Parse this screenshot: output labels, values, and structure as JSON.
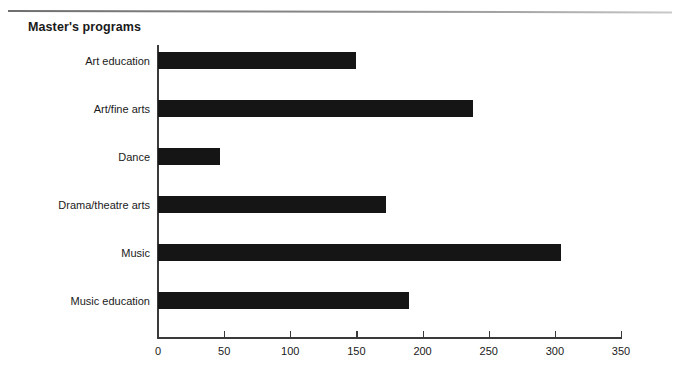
{
  "page": {
    "title": "Master's programs",
    "top_rule": "horizontal-rule"
  },
  "chart_data": {
    "type": "bar",
    "orientation": "horizontal",
    "title": "Master's programs",
    "xlabel": "",
    "ylabel": "",
    "categories": [
      "Art education",
      "Art/fine arts",
      "Dance",
      "Drama/theatre arts",
      "Music",
      "Music education"
    ],
    "values": [
      150,
      238,
      47,
      172,
      305,
      190
    ],
    "xlim": [
      0,
      350
    ],
    "xticks": [
      0,
      50,
      100,
      150,
      200,
      250,
      300,
      350
    ],
    "xtick_labels": [
      "0",
      "50",
      "100",
      "150",
      "200",
      "250",
      "300",
      "350"
    ],
    "grid": false,
    "legend": null,
    "bar_color": "#151515",
    "axis_color": "#3a3a3a",
    "background": "#ffffff"
  }
}
